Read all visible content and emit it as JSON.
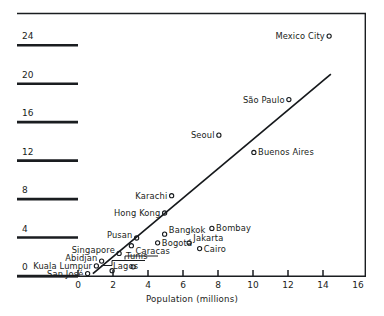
{
  "chart_data": {
    "type": "scatter",
    "title": "",
    "xlabel": "Population (millions)",
    "ylabel": "",
    "xlim": [
      0,
      16
    ],
    "ylim": [
      0,
      26
    ],
    "grid": false,
    "legend": "none",
    "xticks": [
      "0",
      "2",
      "4",
      "6",
      "8",
      "10",
      "12",
      "14",
      "16"
    ],
    "xtick_values": [
      0,
      2,
      4,
      6,
      8,
      10,
      12,
      14,
      16
    ],
    "yticks": [
      "0",
      "4",
      "8",
      "12",
      "16",
      "20",
      "24"
    ],
    "ytick_values": [
      0,
      4,
      8,
      12,
      16,
      20,
      24
    ],
    "marker": "open-circle",
    "points": [
      {
        "label": "San José",
        "x": 0.55,
        "y": 0.25,
        "label_pos": "left"
      },
      {
        "label": "Kuala Lumpur",
        "x": 1.05,
        "y": 1.05,
        "label_pos": "left"
      },
      {
        "label": "Abidjan",
        "x": 1.35,
        "y": 1.55,
        "label_pos": "left-up"
      },
      {
        "label": "Lagos",
        "x": 1.95,
        "y": 0.55,
        "label_pos": "leader-right"
      },
      {
        "label": "Singapore",
        "x": 2.35,
        "y": 2.35,
        "label_pos": "left-up"
      },
      {
        "label": "Caracas",
        "x": 3.05,
        "y": 3.15,
        "label_pos": "right-down"
      },
      {
        "label": "Tunis",
        "x": 3.15,
        "y": 0.95,
        "label_pos": "leader-right"
      },
      {
        "label": "Pusan",
        "x": 3.35,
        "y": 3.95,
        "label_pos": "left-up"
      },
      {
        "label": "Bogotá",
        "x": 4.55,
        "y": 3.45,
        "label_pos": "right"
      },
      {
        "label": "Bangkok",
        "x": 4.95,
        "y": 4.35,
        "label_pos": "right-up"
      },
      {
        "label": "Hong Kong",
        "x": 4.95,
        "y": 6.55,
        "label_pos": "left"
      },
      {
        "label": "Karachi",
        "x": 5.35,
        "y": 8.35,
        "label_pos": "left"
      },
      {
        "label": "Jakarta",
        "x": 6.35,
        "y": 3.45,
        "label_pos": "right-up"
      },
      {
        "label": "Cairo",
        "x": 6.95,
        "y": 2.85,
        "label_pos": "right"
      },
      {
        "label": "Bombay",
        "x": 7.65,
        "y": 4.95,
        "label_pos": "right"
      },
      {
        "label": "Seoul",
        "x": 8.05,
        "y": 14.65,
        "label_pos": "left"
      },
      {
        "label": "Buenos Aires",
        "x": 10.05,
        "y": 12.85,
        "label_pos": "right"
      },
      {
        "label": "São Paulo",
        "x": 12.05,
        "y": 18.35,
        "label_pos": "left"
      },
      {
        "label": "Mexico City",
        "x": 14.35,
        "y": 24.95,
        "label_pos": "left"
      }
    ],
    "fit_line": {
      "type": "line",
      "x_start": 0.85,
      "y_start": 0.25,
      "x_end": 14.45,
      "y_end": 21.0
    }
  },
  "axes": {
    "x_title": "Population (millions)"
  }
}
